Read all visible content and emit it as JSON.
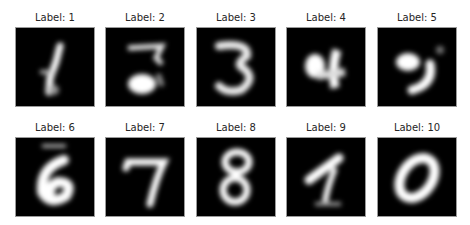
{
  "figure": {
    "panels": [
      {
        "label": "Label: 1",
        "digit_depicted": "1"
      },
      {
        "label": "Label: 2",
        "digit_depicted": "2"
      },
      {
        "label": "Label: 3",
        "digit_depicted": "3"
      },
      {
        "label": "Label: 4",
        "digit_depicted": "4"
      },
      {
        "label": "Label: 5",
        "digit_depicted": "5"
      },
      {
        "label": "Label: 6",
        "digit_depicted": "6"
      },
      {
        "label": "Label: 7",
        "digit_depicted": "7"
      },
      {
        "label": "Label: 8",
        "digit_depicted": "8"
      },
      {
        "label": "Label: 9",
        "digit_depicted": "9"
      },
      {
        "label": "Label: 10",
        "digit_depicted": "0"
      }
    ],
    "colors": {
      "background": "#000000",
      "stroke": "#ffffff",
      "frame": "#9a9a9a",
      "title": "#262626"
    }
  }
}
